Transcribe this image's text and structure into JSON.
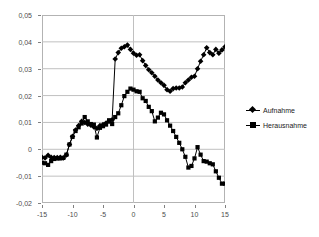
{
  "chart_data": {
    "type": "line",
    "title": "",
    "subtitle": "",
    "xlabel": "",
    "ylabel": "",
    "xlim": [
      -15,
      15
    ],
    "ylim": [
      -0.02,
      0.05
    ],
    "grid": true,
    "grid_axis": "y",
    "legend_position": "right",
    "x_ticks": [
      -15,
      -10,
      -5,
      0,
      5,
      10,
      15
    ],
    "x_tick_labels": [
      "-15",
      "-10",
      "-5",
      "0",
      "5",
      "10",
      "15"
    ],
    "y_ticks": [
      -0.02,
      -0.01,
      0,
      0.01,
      0.02,
      0.03,
      0.04,
      0.05
    ],
    "y_tick_labels": [
      "-0,02",
      "-0,01",
      "0",
      "0,01",
      "0,02",
      "0,03",
      "0,04",
      "0,05"
    ],
    "decimal_separator": ",",
    "line_color": "#000000",
    "grid_color": "#c0c0c0",
    "frame_color": "#b3b3b3",
    "x": [
      -15,
      -14.5,
      -14,
      -13.5,
      -13,
      -12.5,
      -12,
      -11.5,
      -11,
      -10.5,
      -10,
      -9.5,
      -9,
      -8.5,
      -8,
      -7.5,
      -7,
      -6.5,
      -6,
      -5.5,
      -5,
      -4.5,
      -4,
      -3.5,
      -3,
      -2.5,
      -2,
      -1.5,
      -1,
      -0.5,
      0,
      0.5,
      1,
      1.5,
      2,
      2.5,
      3,
      3.5,
      4,
      4.5,
      5,
      5.5,
      6,
      6.5,
      7,
      7.5,
      8,
      8.5,
      9,
      9.5,
      10,
      10.5,
      11,
      11.5,
      12,
      12.5,
      13,
      13.5,
      14,
      14.5,
      15
    ],
    "series": [
      {
        "name": "Aufnahme",
        "marker": "diamond",
        "color": "#000000",
        "values": [
          -0.003,
          -0.0032,
          -0.0022,
          -0.003,
          -0.0031,
          -0.0031,
          -0.003,
          -0.0032,
          -0.0021,
          0.0018,
          0.0048,
          0.0072,
          0.0088,
          0.0104,
          0.01,
          0.0093,
          0.009,
          0.0083,
          0.0078,
          0.0088,
          0.0092,
          0.0098,
          0.0104,
          0.011,
          0.0336,
          0.036,
          0.0376,
          0.0382,
          0.0388,
          0.0372,
          0.0358,
          0.035,
          0.0352,
          0.033,
          0.0312,
          0.0296,
          0.0285,
          0.0272,
          0.0258,
          0.0248,
          0.0238,
          0.0222,
          0.0216,
          0.0226,
          0.0228,
          0.0228,
          0.0232,
          0.0248,
          0.0258,
          0.0268,
          0.0272,
          0.03,
          0.0328,
          0.0352,
          0.0378,
          0.036,
          0.0352,
          0.0372,
          0.0358,
          0.037,
          0.0382
        ]
      },
      {
        "name": "Herausnahme",
        "marker": "square",
        "color": "#000000",
        "values": [
          -0.005,
          -0.0052,
          -0.0058,
          -0.0044,
          -0.0036,
          -0.0034,
          -0.0034,
          -0.0032,
          -0.002,
          0.0018,
          0.0046,
          0.0068,
          0.0082,
          0.0096,
          0.012,
          0.0104,
          0.0094,
          0.0092,
          0.0044,
          0.008,
          0.0086,
          0.0092,
          0.0108,
          0.0094,
          0.012,
          0.0134,
          0.0164,
          0.0198,
          0.0214,
          0.0226,
          0.0222,
          0.0216,
          0.0214,
          0.019,
          0.018,
          0.0158,
          0.0142,
          0.0104,
          0.0118,
          0.0136,
          0.013,
          0.0108,
          0.0088,
          0.0068,
          0.0046,
          0.0024,
          0.0,
          -0.0028,
          -0.0068,
          -0.0062,
          -0.0034,
          0.0008,
          -0.002,
          -0.0044,
          -0.0046,
          -0.0052,
          -0.0056,
          -0.0082,
          -0.0106,
          -0.0128,
          -0.0128
        ]
      }
    ]
  },
  "legend": {
    "items": [
      {
        "label": "Aufnahme",
        "marker": "diamond"
      },
      {
        "label": "Herausnahme",
        "marker": "square"
      }
    ]
  }
}
